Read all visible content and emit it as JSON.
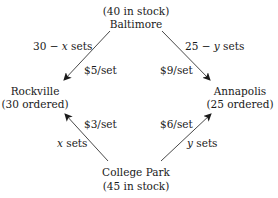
{
  "nodes": {
    "baltimore": {
      "name": "Baltimore",
      "note": "(40 in stock)"
    },
    "rockville": {
      "name": "Rockville",
      "note": "(30 ordered)"
    },
    "annapolis": {
      "name": "Annapolis",
      "note": "(25 ordered)"
    },
    "college_park": {
      "name": "College Park",
      "note": "(45 in stock)"
    }
  },
  "edges": {
    "baltimore_rockville": {
      "qty_prefix": "30 − ",
      "qty_var": "x",
      "qty_suffix": " sets",
      "cost": "$5/set"
    },
    "baltimore_annapolis": {
      "qty_prefix": "25 − ",
      "qty_var": "y",
      "qty_suffix": " sets",
      "cost": "$9/set"
    },
    "collegepark_rockville": {
      "qty_var": "x",
      "qty_suffix": " sets",
      "cost": "$3/set"
    },
    "collegepark_annapolis": {
      "qty_var": "y",
      "qty_suffix": " sets",
      "cost": "$6/set"
    }
  },
  "colors": {
    "ink": "#1a1a1a",
    "background": "#ffffff"
  }
}
